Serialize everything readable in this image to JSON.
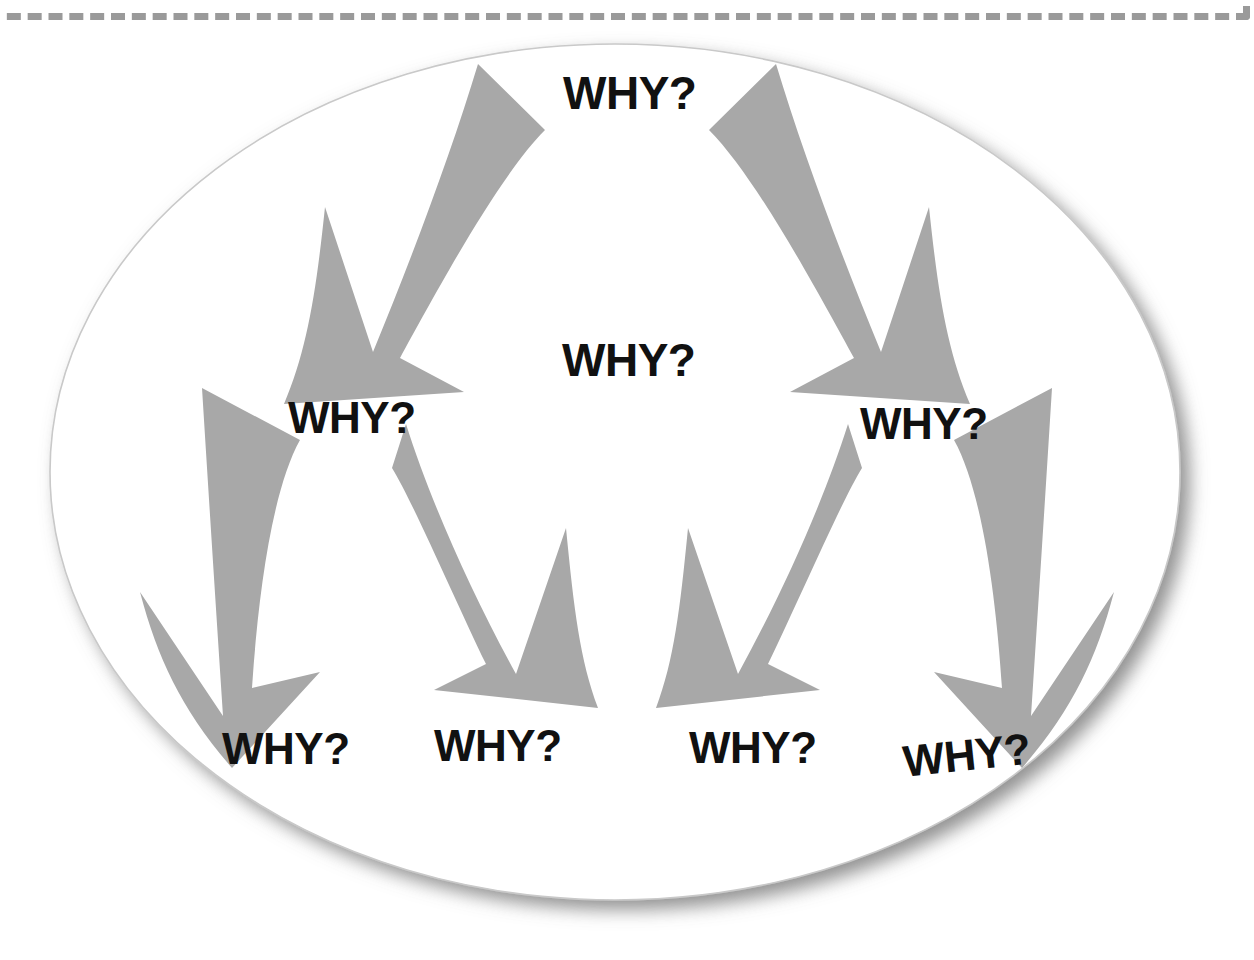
{
  "diagram": {
    "type": "why-tree",
    "container_shape": "ellipse",
    "colors": {
      "arrow": "#a8a8a8",
      "text": "#111111",
      "ellipse_fill": "#ffffff",
      "ellipse_stroke": "#c9c9c9",
      "dashed_frame": "#9a9a9a",
      "background": "#ffffff"
    },
    "frame": {
      "style": "dashed",
      "label": "slide-placeholder-border"
    },
    "nodes": [
      {
        "id": "n0",
        "label": "WHY?",
        "level": 0,
        "x": 563,
        "y": 70,
        "font_size": 46
      },
      {
        "id": "n1",
        "label": "WHY?",
        "level": 1,
        "x": 562,
        "y": 337,
        "font_size": 46
      },
      {
        "id": "n2",
        "label": "WHY?",
        "level": 2,
        "x": 288,
        "y": 396,
        "font_size": 44
      },
      {
        "id": "n3",
        "label": "WHY?",
        "level": 2,
        "x": 860,
        "y": 402,
        "font_size": 44
      },
      {
        "id": "n4",
        "label": "WHY?",
        "level": 3,
        "x": 222,
        "y": 727,
        "font_size": 44
      },
      {
        "id": "n5",
        "label": "WHY?",
        "level": 3,
        "x": 434,
        "y": 724,
        "font_size": 44
      },
      {
        "id": "n6",
        "label": "WHY?",
        "level": 3,
        "x": 689,
        "y": 726,
        "font_size": 44
      },
      {
        "id": "n7",
        "label": "WHY?",
        "level": 3,
        "x": 901,
        "y": 740,
        "font_size": 44,
        "rotate": -6
      }
    ],
    "arrows": [
      {
        "id": "a1",
        "from": "n0",
        "to": "n2",
        "direction": "down-left"
      },
      {
        "id": "a2",
        "from": "n0",
        "to": "n3",
        "direction": "down-right"
      },
      {
        "id": "a3",
        "from": "n2",
        "to": "n4",
        "direction": "down-left"
      },
      {
        "id": "a4",
        "from": "n2",
        "to": "n5",
        "direction": "down-right"
      },
      {
        "id": "a5",
        "from": "n3",
        "to": "n6",
        "direction": "down-left"
      },
      {
        "id": "a6",
        "from": "n3",
        "to": "n7",
        "direction": "down-right"
      }
    ],
    "arrow_count": 6,
    "node_count": 8
  }
}
